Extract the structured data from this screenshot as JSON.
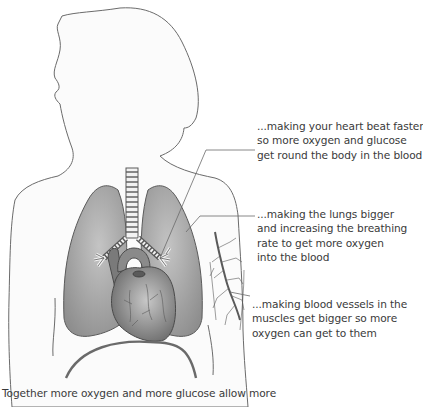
{
  "diagram": {
    "annotations": [
      {
        "id": "heart",
        "lines": [
          "...making your heart beat faster",
          "so more oxygen and glucose",
          "get round the body in the blood"
        ]
      },
      {
        "id": "lungs",
        "lines": [
          "...making the lungs bigger",
          "and increasing the breathing",
          "rate to get more oxygen",
          "into the blood"
        ]
      },
      {
        "id": "blood-vessels",
        "lines": [
          "...making blood vessels in the",
          "muscles get bigger so more",
          "oxygen can get to them"
        ]
      }
    ],
    "caption": "Together more oxygen and more glucose allow more"
  },
  "colors": {
    "outline": "#6b6b6b",
    "body_fill": "#fbfbfb",
    "lung_fill": "#a9a9a9",
    "heart_fill": "#8f8f8f",
    "text": "#3a3a3a"
  }
}
